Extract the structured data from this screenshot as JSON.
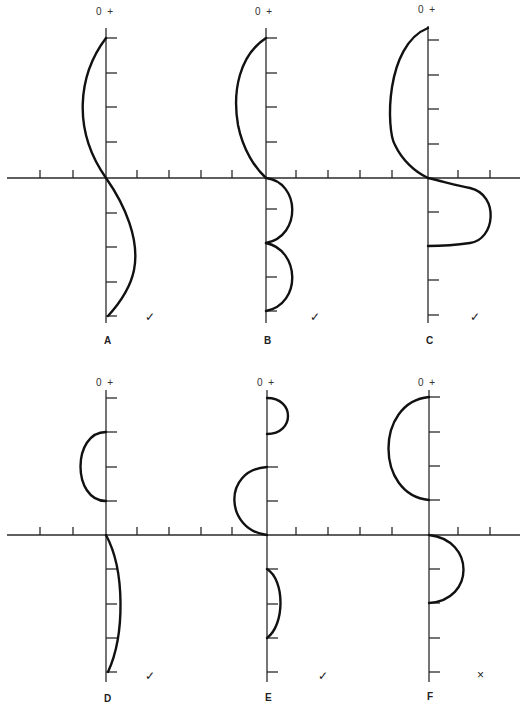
{
  "figure": {
    "type": "diagram"
  },
  "axis_labels": {
    "zero": "0",
    "plus": "+"
  },
  "panels": [
    {
      "id": "A",
      "letter": "A",
      "mark": "✓",
      "mark_name": "check"
    },
    {
      "id": "B",
      "letter": "B",
      "mark": "✓",
      "mark_name": "check"
    },
    {
      "id": "C",
      "letter": "C",
      "mark": "✓",
      "mark_name": "check"
    },
    {
      "id": "D",
      "letter": "D",
      "mark": "✓",
      "mark_name": "check"
    },
    {
      "id": "E",
      "letter": "E",
      "mark": "✓",
      "mark_name": "check"
    },
    {
      "id": "F",
      "letter": "F",
      "mark": "×",
      "mark_name": "cross"
    }
  ],
  "colors": {
    "line": "#111111",
    "axis": "#2a2a2a",
    "background": "#ffffff"
  }
}
